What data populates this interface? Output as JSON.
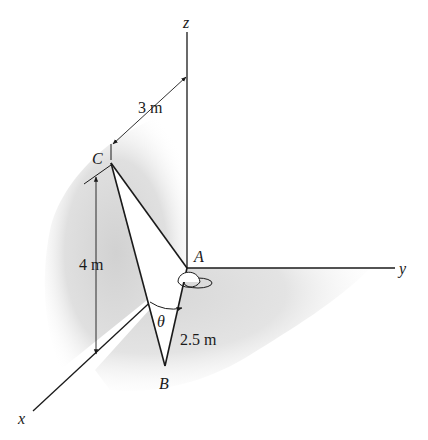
{
  "figure": {
    "type": "3D statics diagram",
    "axes": {
      "x": "x",
      "y": "y",
      "z": "z"
    },
    "points": {
      "A": "A",
      "B": "B",
      "C": "C"
    },
    "dimensions": {
      "horizontal_offset": "3 m",
      "height": "4 m",
      "member_length": "2.5 m"
    },
    "angle": "θ",
    "colors": {
      "line": "#1a1a1a",
      "shade": "#d9d9d9",
      "background": "#ffffff"
    }
  }
}
